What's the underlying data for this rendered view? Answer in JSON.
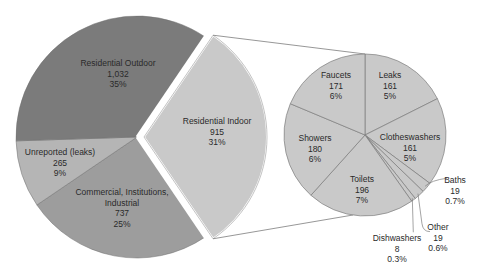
{
  "chart_data": {
    "type": "pie",
    "subtype": "pie-of-pie",
    "title": "",
    "main_pie": {
      "slices": [
        {
          "name": "Residential Outdoor",
          "value": 1032,
          "percent": "35%",
          "color": "#7b7b7b"
        },
        {
          "name": "Residential Indoor",
          "value": 915,
          "percent": "31%",
          "color": "#c9c9c9",
          "exploded": true
        },
        {
          "name": "Commercial, Institutions, Industrial",
          "value": 737,
          "percent": "25%",
          "color": "#9d9d9d"
        },
        {
          "name": "Unreported (leaks)",
          "value": 265,
          "percent": "9%",
          "color": "#b5b5b5"
        }
      ]
    },
    "secondary_pie": {
      "parent": "Residential Indoor",
      "color": "#c9c9c9",
      "slices": [
        {
          "name": "Leaks",
          "value": 161,
          "percent": "5%"
        },
        {
          "name": "Clotheswashers",
          "value": 161,
          "percent": "5%"
        },
        {
          "name": "Baths",
          "value": 19,
          "percent": "0.7%"
        },
        {
          "name": "Other",
          "value": 19,
          "percent": "0.6%"
        },
        {
          "name": "Dishwashers",
          "value": 8,
          "percent": "0.3%"
        },
        {
          "name": "Toilets",
          "value": 196,
          "percent": "7%"
        },
        {
          "name": "Showers",
          "value": 180,
          "percent": "6%"
        },
        {
          "name": "Faucets",
          "value": 171,
          "percent": "6%"
        }
      ]
    },
    "legend": "none",
    "data_labels": "category, value, percent"
  },
  "labels": {
    "outdoor": {
      "name": "Residential Outdoor",
      "value": "1,032",
      "pct": "35%"
    },
    "indoor": {
      "name": "Residential Indoor",
      "value": "915",
      "pct": "31%"
    },
    "unreported": {
      "name": "Unreported (leaks)",
      "value": "265",
      "pct": "9%"
    },
    "commercial": {
      "line1": "Commercial, Institutions,",
      "line2": "Industrial",
      "value": "737",
      "pct": "25%"
    },
    "faucets": {
      "name": "Faucets",
      "value": "171",
      "pct": "6%"
    },
    "leaks": {
      "name": "Leaks",
      "value": "161",
      "pct": "5%"
    },
    "showers": {
      "name": "Showers",
      "value": "180",
      "pct": "6%"
    },
    "clotheswashers": {
      "name": "Clotheswashers",
      "value": "161",
      "pct": "5%"
    },
    "toilets": {
      "name": "Toilets",
      "value": "196",
      "pct": "7%"
    },
    "baths": {
      "name": "Baths",
      "value": "19",
      "pct": "0.7%"
    },
    "other": {
      "name": "Other",
      "value": "19",
      "pct": "0.6%"
    },
    "dishwashers": {
      "name": "Dishwashers",
      "value": "8",
      "pct": "0.3%"
    }
  }
}
